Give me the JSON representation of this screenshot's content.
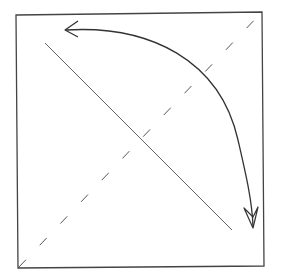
{
  "diagram": {
    "colors": {
      "background": "#ffffff",
      "stroke": "#333333",
      "light_stroke": "#666666"
    },
    "square": {
      "top_left": [
        16,
        15
      ],
      "top_right": [
        262,
        12
      ],
      "bottom_right": [
        264,
        266
      ],
      "bottom_left": [
        18,
        268
      ]
    },
    "solid_diagonal": {
      "from": [
        45,
        43
      ],
      "to": [
        232,
        230
      ]
    },
    "dashed_diagonal": {
      "from": [
        19,
        267
      ],
      "to": [
        261,
        13
      ]
    },
    "curved_arrow": {
      "from": [
        65,
        30
      ],
      "to": [
        253,
        228
      ],
      "heads": [
        "start",
        "end"
      ]
    }
  }
}
